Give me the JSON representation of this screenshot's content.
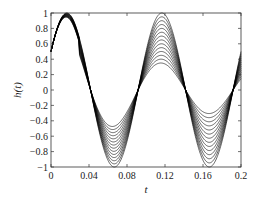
{
  "chart_data": {
    "type": "line",
    "title": "",
    "xlabel": "t",
    "ylabel": "h(t)",
    "xlim": [
      0,
      0.2
    ],
    "ylim": [
      -1,
      1
    ],
    "grid": false,
    "legend": null,
    "x_ticks": [
      0,
      0.04,
      0.08,
      0.12,
      0.16,
      0.2
    ],
    "x_tick_labels": [
      "0",
      "0.04",
      "0.08",
      "0.12",
      "0.16",
      "0.2"
    ],
    "y_ticks": [
      -1,
      -0.8,
      -0.6,
      -0.4,
      -0.2,
      0,
      0.2,
      0.4,
      0.6,
      0.8,
      1
    ],
    "y_tick_labels": [
      "−1",
      "−0.8",
      "−0.6",
      "−0.4",
      "−0.2",
      "0",
      "0.2",
      "0.4",
      "0.6",
      "0.8",
      "1"
    ],
    "family": {
      "description": "Family of ~14 sinusoidal curves (frequency ~10 Hz) with h(0)≈0.5; amplitudes spread over time. Peaks near t≈0.017 (≈0.9–1), troughs near t≈0.067 (−0.5 to −1), peaks near t≈0.117 (0.5 to 1), troughs near t≈0.167 (−0.3 to −1).",
      "frequency_hz": 10,
      "phase_rad": 0.5236,
      "num_curves": 14,
      "approx_extrema": [
        {
          "t": 0.017,
          "min": 0.88,
          "max": 1.0
        },
        {
          "t": 0.067,
          "min": -1.0,
          "max": -0.5
        },
        {
          "t": 0.117,
          "min": 0.5,
          "max": 1.0
        },
        {
          "t": 0.167,
          "min": -1.0,
          "max": -0.3
        }
      ]
    },
    "line_color": "#000000"
  }
}
